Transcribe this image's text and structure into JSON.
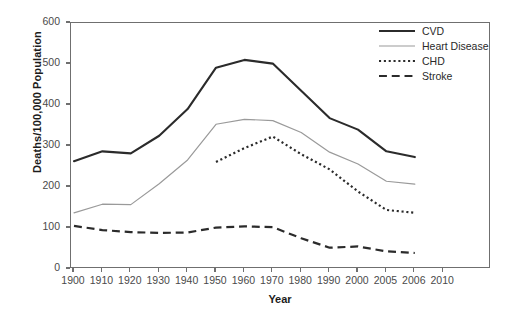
{
  "chart_data": {
    "type": "line",
    "title": "",
    "xlabel": "Year",
    "ylabel": "Deaths/100,000 Population",
    "categories": [
      "1900",
      "1910",
      "1920",
      "1930",
      "1940",
      "1950",
      "1960",
      "1970",
      "1980",
      "1990",
      "2000",
      "2005",
      "2006",
      "2010"
    ],
    "xtick_labels": [
      "1900",
      "1910",
      "1920",
      "1930",
      "1940",
      "1950",
      "1960",
      "1970",
      "1980",
      "1990",
      "2000",
      "2005",
      "2006",
      "2010"
    ],
    "ytick_labels": [
      "0",
      "100",
      "200",
      "300",
      "400",
      "500",
      "600"
    ],
    "ylim": [
      0,
      600
    ],
    "ytick_values": [
      0,
      100,
      200,
      300,
      400,
      500,
      600
    ],
    "grid": false,
    "legend_position": "top-right",
    "series": [
      {
        "name": "CVD",
        "style": "solid",
        "color": "#2b2b2b",
        "width": 2.1,
        "x": [
          "1900",
          "1910",
          "1920",
          "1930",
          "1940",
          "1950",
          "1960",
          "1970",
          "1980",
          "1990",
          "2000",
          "2005",
          "2006"
        ],
        "values": [
          263,
          287,
          282,
          325,
          390,
          491,
          510,
          501,
          435,
          368,
          340,
          287,
          273
        ]
      },
      {
        "name": "Heart Disease",
        "style": "solid",
        "color": "#9a9a9a",
        "width": 1.2,
        "x": [
          "1900",
          "1910",
          "1920",
          "1930",
          "1940",
          "1950",
          "1960",
          "1970",
          "1980",
          "1990",
          "2000",
          "2005",
          "2006"
        ],
        "values": [
          137,
          158,
          157,
          208,
          266,
          353,
          365,
          362,
          333,
          285,
          256,
          214,
          207
        ]
      },
      {
        "name": "CHD",
        "style": "dotted",
        "color": "#2b2b2b",
        "width": 2.2,
        "x": [
          "1950",
          "1960",
          "1970",
          "1980",
          "1990",
          "2000",
          "2005",
          "2006"
        ],
        "values": [
          261,
          295,
          323,
          280,
          243,
          189,
          144,
          137
        ]
      },
      {
        "name": "Stroke",
        "style": "dashed",
        "color": "#2b2b2b",
        "width": 2.2,
        "x": [
          "1900",
          "1910",
          "1920",
          "1930",
          "1940",
          "1950",
          "1960",
          "1970",
          "1980",
          "1990",
          "2000",
          "2005",
          "2006"
        ],
        "values": [
          105,
          95,
          90,
          88,
          89,
          101,
          104,
          102,
          75,
          52,
          55,
          43,
          39
        ]
      }
    ]
  },
  "legend": {
    "items": [
      {
        "label": "CVD"
      },
      {
        "label": "Heart Disease"
      },
      {
        "label": "CHD"
      },
      {
        "label": "Stroke"
      }
    ]
  },
  "axes": {
    "x_title": "Year",
    "y_title": "Deaths/100,000 Population"
  }
}
